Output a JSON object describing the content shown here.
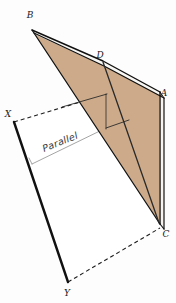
{
  "figure": {
    "background_color": "#fdfdfd",
    "canvas": {
      "width": 176,
      "height": 303
    }
  },
  "colors": {
    "plane_fill": "#cdab8a",
    "plane_fill_light": "#d6b896",
    "slab_edge_white": "#f7f4f0",
    "stroke_dark": "#111111",
    "stroke_gray": "#9a9a9a",
    "label_color": "#1a1a1a"
  },
  "labels": {
    "B": {
      "text": "B",
      "x": 30,
      "y": 18
    },
    "D": {
      "text": "D",
      "x": 100,
      "y": 58
    },
    "A": {
      "text": "A",
      "x": 161,
      "y": 96
    },
    "C": {
      "text": "C",
      "x": 162,
      "y": 236
    },
    "X": {
      "text": "X",
      "x": 7,
      "y": 117
    },
    "Y": {
      "text": "Y",
      "x": 65,
      "y": 295
    },
    "parallel": {
      "text": "Parallel",
      "x": 44,
      "y": 152,
      "rotation": -22
    }
  },
  "vertices": {
    "B": {
      "x": 32,
      "y": 30
    },
    "D": {
      "x": 103,
      "y": 63
    },
    "A": {
      "x": 160,
      "y": 95
    },
    "C": {
      "x": 160,
      "y": 225
    },
    "X": {
      "x": 14,
      "y": 122
    },
    "Y": {
      "x": 68,
      "y": 282
    }
  },
  "shapes": {
    "upper_plane": "B-D-A-C (tan shaded slab)",
    "inner_triangle": "B-D-C",
    "lower_plane": "X-Y parallelogram with dashed back edges",
    "parallel_line": "gray guide line labelled Parallel"
  }
}
